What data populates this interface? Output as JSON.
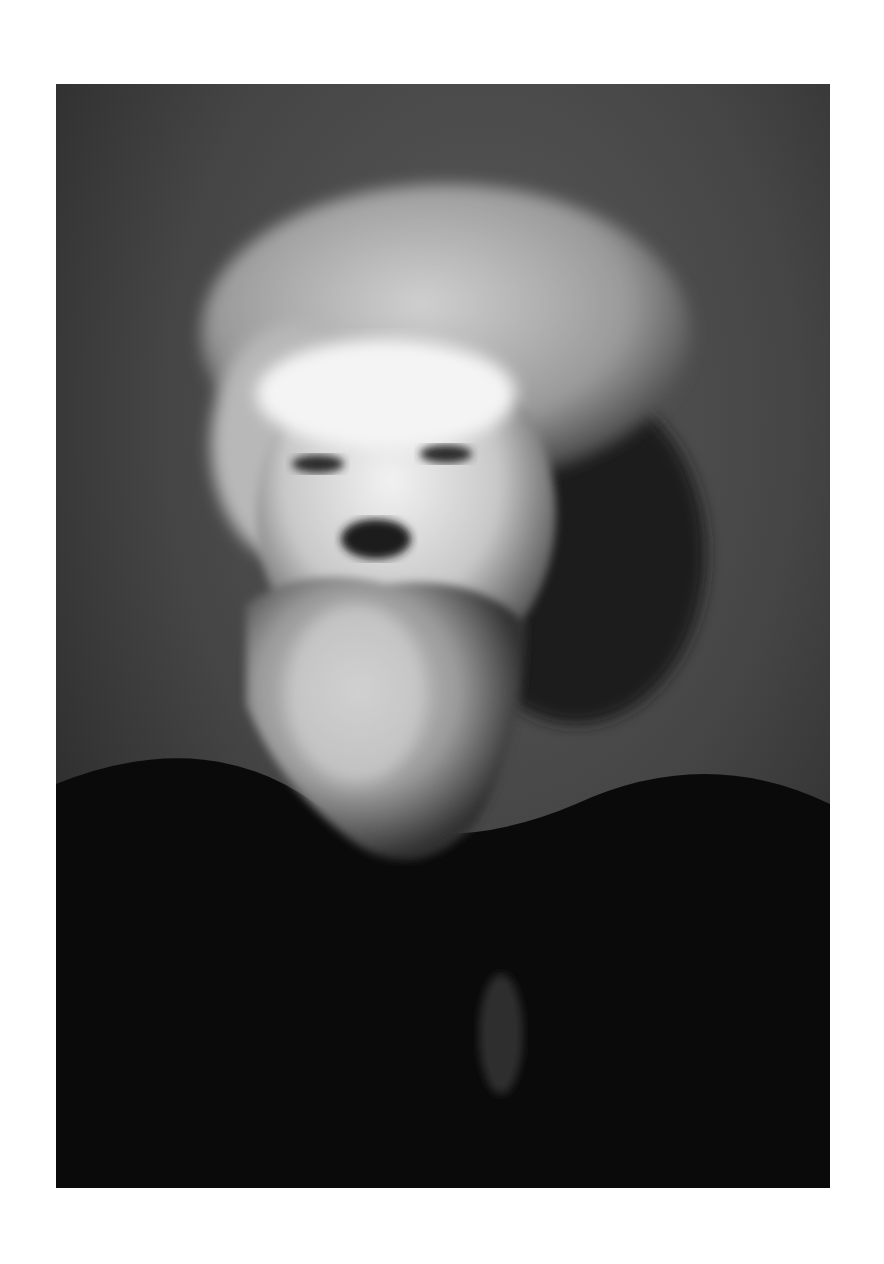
{
  "image": {
    "description": "Black-and-white portrait of an older man with wild, wavy light-gray hair and a full bushy white beard, wearing a dark coat, against a mottled dark-gray background",
    "palette": {
      "page_background": "#ffffff",
      "background_gray": "#4a4a4a",
      "background_dark": "#2a2a2a",
      "hair_light": "#d8d8d8",
      "face_light": "#e6e6e6",
      "shadow": "#1a1a1a",
      "coat": "#080808"
    }
  }
}
